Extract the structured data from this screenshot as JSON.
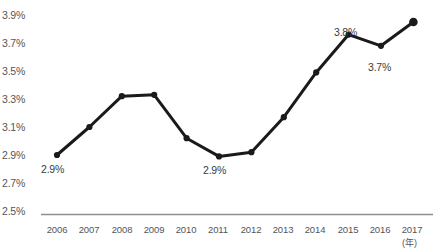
{
  "chart_data": {
    "type": "line",
    "title": "",
    "subtitle": "",
    "xlabel": "(年)",
    "ylabel": "",
    "categories": [
      "2006",
      "2007",
      "2008",
      "2009",
      "2010",
      "2011",
      "2012",
      "2013",
      "2014",
      "2015",
      "2016",
      "2017"
    ],
    "values": [
      2.9,
      3.1,
      3.32,
      3.33,
      3.02,
      2.89,
      2.92,
      3.17,
      3.49,
      3.76,
      3.68,
      3.85
    ],
    "series": [
      {
        "name": "",
        "values": [
          2.9,
          3.1,
          3.32,
          3.33,
          3.02,
          2.89,
          2.92,
          3.17,
          3.49,
          3.76,
          3.68,
          3.85
        ]
      }
    ],
    "ylim": [
      2.5,
      3.9
    ],
    "y_ticks": [
      "3.9%",
      "3.7%",
      "3.5%",
      "3.3%",
      "3.1%",
      "2.9%",
      "2.7%",
      "2.5%"
    ],
    "y_tick_values": [
      3.9,
      3.7,
      3.5,
      3.3,
      3.1,
      2.9,
      2.7,
      2.5
    ],
    "grid": false,
    "legend": "none",
    "line_color": "#1a1a1a",
    "marker_color": "#1a1a1a",
    "axis_color": "#8c8f92",
    "text_color": "#53565a",
    "data_labels": [
      {
        "category": "2006",
        "text": "2.9%",
        "position": "below"
      },
      {
        "category": "2011",
        "text": "2.9%",
        "position": "below"
      },
      {
        "category": "2015",
        "text": "3.8%",
        "position": "above"
      },
      {
        "category": "2016",
        "text": "3.7%",
        "position": "below"
      }
    ],
    "annotations": []
  },
  "axis": {
    "y_labels": [
      "3.9%",
      "3.7%",
      "3.5%",
      "3.3%",
      "3.1%",
      "2.9%",
      "2.7%",
      "2.5%"
    ],
    "x_labels": [
      "2006",
      "2007",
      "2008",
      "2009",
      "2010",
      "2011",
      "2012",
      "2013",
      "2014",
      "2015",
      "2016",
      "2017"
    ],
    "x_unit": "(年)"
  },
  "labels": {
    "l0": "2.9%",
    "l1": "2.9%",
    "l2": "3.8%",
    "l3": "3.7%"
  }
}
